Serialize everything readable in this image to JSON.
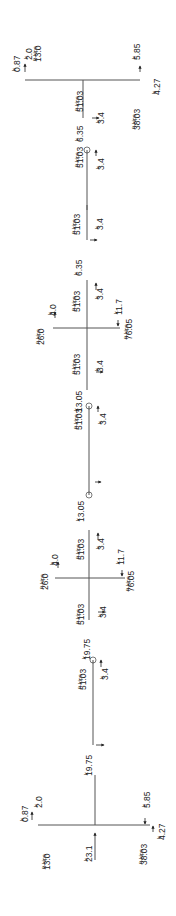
{
  "diagram": {
    "type": "free-body-diagram",
    "orientation": "rotated-90-ccw",
    "units": {
      "force": "k",
      "moment": "ft-kips"
    },
    "colors": {
      "line": "#555555",
      "text": "#222222",
      "background": "#ffffff"
    }
  },
  "joints": [
    {
      "id": "left-end",
      "loads": [
        {
          "label": "0.87",
          "unit": "k"
        },
        {
          "label": "2.0",
          "unit": "k"
        },
        {
          "label": "13.0",
          "unit": "ft-kips"
        },
        {
          "label": "23.1",
          "unit": "k"
        },
        {
          "label": "38.03",
          "unit": "ft-kips"
        },
        {
          "label": "5.85",
          "unit": "k"
        },
        {
          "label": "4.27",
          "unit": "k"
        }
      ]
    },
    {
      "id": "interior-1",
      "loads": [
        {
          "label": "26.0",
          "unit": "ft-kips"
        },
        {
          "label": "4.0",
          "unit": "k"
        },
        {
          "label": "11.7",
          "unit": "k"
        },
        {
          "label": "76.05",
          "unit": "ft-kips"
        }
      ]
    },
    {
      "id": "interior-2",
      "loads": [
        {
          "label": "26.0",
          "unit": "ft-kips"
        },
        {
          "label": "4.0",
          "unit": "k"
        },
        {
          "label": "11.7",
          "unit": "k"
        },
        {
          "label": "76.05",
          "unit": "ft-kips"
        }
      ]
    },
    {
      "id": "right-end",
      "loads": [
        {
          "label": "0.87",
          "unit": "k"
        },
        {
          "label": "2.0",
          "unit": "k"
        },
        {
          "label": "13.0",
          "unit": "ft-kips"
        },
        {
          "label": "38.03",
          "unit": "ft-kips"
        },
        {
          "label": "5.85",
          "unit": "k"
        },
        {
          "label": "4.27",
          "unit": "k"
        }
      ]
    }
  ],
  "segments": [
    {
      "moment": "51.03",
      "moment_unit": "ft-kips",
      "shear": "3.4",
      "shear_unit": "k",
      "axial": "19.75",
      "axial_unit": "k"
    },
    {
      "moment": "51.03",
      "moment_unit": "ft-kips",
      "shear": "3.4",
      "shear_unit": "k",
      "axial": "19.75",
      "axial_unit": "k"
    },
    {
      "moment": "51.03",
      "moment_unit": "ft-kips",
      "shear": "3.4",
      "shear_unit": "k",
      "axial": "13.05",
      "axial_unit": "k"
    },
    {
      "moment": "51.03",
      "moment_unit": "ft-kips",
      "shear": "3.4",
      "shear_unit": "k",
      "axial": "13.05",
      "axial_unit": "k"
    },
    {
      "moment": "51.03",
      "moment_unit": "ft-kips",
      "shear": "3.4",
      "shear_unit": "k",
      "axial": "6.35",
      "axial_unit": "k"
    },
    {
      "moment": "51.03",
      "moment_unit": "ft-kips",
      "shear": "3.4",
      "shear_unit": "k",
      "axial": "6.35",
      "axial_unit": "k"
    }
  ],
  "labels": {
    "l_0_87_top": "0.87",
    "l_2_0_top": "2.0",
    "l_13_0_top": "13.0",
    "l_5_85_top": "5.85",
    "l_4_27_top": "4.27",
    "l_38_03_top": "38.03",
    "l_51_03_a": "51.03",
    "l_3_4_a": "3.4",
    "l_6_35_a": "6.35",
    "l_51_03_b": "51.03",
    "l_3_4_b": "3.4",
    "l_51_03_c": "51.03",
    "l_3_4_c": "3.4",
    "l_6_35_b": "6.35",
    "l_26_0_a": "26.0",
    "l_4_0_a": "4.0",
    "l_11_7_a": "11.7",
    "l_76_05_a": "76.05",
    "l_51_03_d": "51.03",
    "l_3_4_d": "3.4",
    "l_13_05_a": "13.05",
    "l_51_03_e": "51.03",
    "l_3_4_e": "3.4",
    "l_13_05_b": "13.05",
    "l_51_03_f": "51.03",
    "l_3_4_f": "3.4",
    "l_26_0_b": "26.0",
    "l_4_0_b": "4.0",
    "l_11_7_b": "11.7",
    "l_76_05_b": "76.05",
    "l_51_03_g": "51.03",
    "l_3_4_g": "3.4",
    "l_19_75_a": "19.75",
    "l_51_03_h": "51.03",
    "l_3_4_h": "3.4",
    "l_19_75_b": "19.75",
    "l_51_03_i": "51.03",
    "l_3_4_i": "3.4",
    "l_0_87_bot": "0.87",
    "l_2_0_bot": "2.0",
    "l_13_0_bot": "13.0",
    "l_23_1": "23.1",
    "l_38_03_bot": "38.03",
    "l_5_85_bot": "5.85",
    "l_4_27_bot": "4.27",
    "unit_k": "k",
    "unit_ftkips": "ft-kips"
  }
}
